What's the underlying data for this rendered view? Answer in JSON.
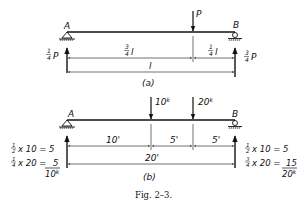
{
  "figure": {
    "caption": "Fig. 2–3.",
    "colors": {
      "ink": "#111111",
      "background": "#ffffff"
    }
  },
  "panel_a": {
    "label": "(a)",
    "support_left": "A",
    "support_right": "B",
    "load": "P",
    "reaction_left": {
      "num": "1",
      "den": "4",
      "sym": "P"
    },
    "reaction_right": {
      "num": "3",
      "den": "4",
      "sym": "P"
    },
    "dim_left": {
      "num": "3",
      "den": "4",
      "sym": "l"
    },
    "dim_right": {
      "num": "1",
      "den": "4",
      "sym": "l"
    },
    "dim_total": "l"
  },
  "panel_b": {
    "label": "(b)",
    "support_left": "A",
    "support_right": "B",
    "load_1": "10",
    "load_1_unit": "k",
    "load_2": "20",
    "load_2_unit": "k",
    "dim_1": "10'",
    "dim_2": "5'",
    "dim_3": "5'",
    "dim_total": "20'",
    "left_calc_1": {
      "num": "1",
      "den": "2",
      "expr": "x 10 = 5"
    },
    "left_calc_2": {
      "num": "1",
      "den": "4",
      "expr": "x 20 ="
    },
    "left_sum": {
      "top": "5",
      "bottom": "10",
      "unit": "k"
    },
    "right_calc_1": {
      "num": "1",
      "den": "2",
      "expr": "x 10 = 5"
    },
    "right_calc_2": {
      "num": "3",
      "den": "4",
      "expr": "x 20 ="
    },
    "right_sum": {
      "top": "15",
      "bottom": "20",
      "unit": "k"
    }
  }
}
